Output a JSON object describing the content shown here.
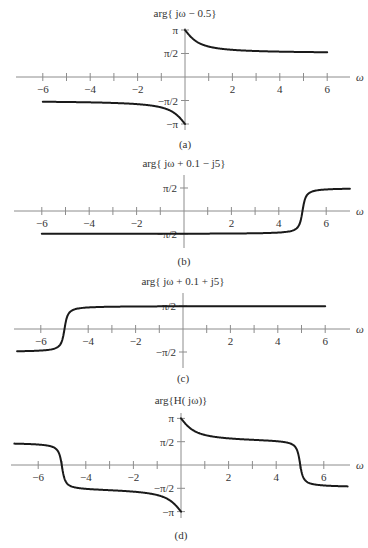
{
  "chart_data": [
    {
      "type": "line",
      "id": "a",
      "title": "arg{ jω − 0.5}",
      "caption": "(a)",
      "xlabel": "ω",
      "function": "atan2(w, -0.5)",
      "x_range": [
        -6,
        6
      ],
      "xlim": [
        -7,
        7
      ],
      "ylim": [
        -3.1416,
        3.1416
      ],
      "xticks": [
        -6,
        -5,
        -4,
        -3,
        -2,
        -1,
        1,
        2,
        3,
        4,
        5,
        6
      ],
      "xtick_labels": [
        {
          "v": -6,
          "t": "−6"
        },
        {
          "v": -4,
          "t": "−4"
        },
        {
          "v": -2,
          "t": "−2"
        },
        {
          "v": 2,
          "t": "2"
        },
        {
          "v": 4,
          "t": "4"
        },
        {
          "v": 6,
          "t": "6"
        }
      ],
      "yticks": [
        {
          "v": 3.1416,
          "t": "π"
        },
        {
          "v": 1.5708,
          "t": "π/2"
        },
        {
          "v": -1.5708,
          "t": "−π/2"
        },
        {
          "v": -3.1416,
          "t": "−π"
        }
      ],
      "samples": {
        "x": [
          -6,
          -4,
          -2,
          -1,
          -0.5,
          -0.1,
          0.1,
          0.5,
          1,
          2,
          4,
          6
        ],
        "y": [
          -1.654,
          -1.695,
          -1.816,
          -2.034,
          -2.356,
          -2.944,
          2.944,
          2.356,
          2.034,
          1.816,
          1.695,
          1.654
        ]
      },
      "grid": false
    },
    {
      "type": "line",
      "id": "b",
      "title": "arg{ jω + 0.1 − j5}",
      "caption": "(b)",
      "xlabel": "ω",
      "function": "atan2(w - 5, 0.1)",
      "x_range": [
        -6,
        7
      ],
      "xlim": [
        -7,
        7
      ],
      "ylim": [
        -1.5708,
        1.5708
      ],
      "xticks": [
        -6,
        -5,
        -4,
        -3,
        -2,
        -1,
        1,
        2,
        3,
        4,
        5,
        6
      ],
      "xtick_labels": [
        {
          "v": -6,
          "t": "−6"
        },
        {
          "v": -4,
          "t": "−4"
        },
        {
          "v": -2,
          "t": "−2"
        },
        {
          "v": 2,
          "t": "2"
        },
        {
          "v": 4,
          "t": "4"
        },
        {
          "v": 6,
          "t": "6"
        }
      ],
      "yticks": [
        {
          "v": 1.5708,
          "t": "π/2"
        },
        {
          "v": -1.5708,
          "t": "−π/2"
        }
      ],
      "samples": {
        "x": [
          -6,
          0,
          4,
          4.5,
          5,
          5.5,
          6,
          7
        ],
        "y": [
          -1.562,
          -1.551,
          -1.471,
          -1.373,
          0,
          1.373,
          1.471,
          1.521
        ]
      },
      "grid": false
    },
    {
      "type": "line",
      "id": "c",
      "title": "arg{ jω + 0.1 + j5}",
      "caption": "(c)",
      "xlabel": "ω",
      "function": "atan2(w + 5, 0.1)",
      "x_range": [
        -7,
        6
      ],
      "xlim": [
        -7,
        7
      ],
      "ylim": [
        -1.5708,
        1.5708
      ],
      "xticks": [
        -6,
        -5,
        -4,
        -3,
        -2,
        -1,
        1,
        2,
        3,
        4,
        5,
        6
      ],
      "xtick_labels": [
        {
          "v": -6,
          "t": "−6"
        },
        {
          "v": -4,
          "t": "−4"
        },
        {
          "v": -2,
          "t": "−2"
        },
        {
          "v": 2,
          "t": "2"
        },
        {
          "v": 4,
          "t": "4"
        },
        {
          "v": 6,
          "t": "6"
        }
      ],
      "yticks": [
        {
          "v": 1.5708,
          "t": "π/2"
        },
        {
          "v": -1.5708,
          "t": "−π/2"
        }
      ],
      "samples": {
        "x": [
          -7,
          -6,
          -5.5,
          -5,
          -4.5,
          -4,
          0,
          6
        ],
        "y": [
          -1.521,
          -1.471,
          -1.373,
          0,
          1.373,
          1.471,
          1.551,
          1.562
        ]
      },
      "grid": false
    },
    {
      "type": "line",
      "id": "d",
      "title": "arg{H( jω)}",
      "caption": "(d)",
      "xlabel": "ω",
      "function": "atan2(w,-0.5) - atan2(w-5,0.1) - atan2(w+5,0.1)",
      "x_range": [
        -7,
        7
      ],
      "xlim": [
        -7,
        7
      ],
      "ylim": [
        -3.1416,
        3.1416
      ],
      "xticks": [
        -6,
        -5,
        -4,
        -3,
        -2,
        -1,
        1,
        2,
        3,
        4,
        5,
        6
      ],
      "xtick_labels": [
        {
          "v": -6,
          "t": "−6"
        },
        {
          "v": -4,
          "t": "−4"
        },
        {
          "v": -2,
          "t": "−2"
        },
        {
          "v": 2,
          "t": "2"
        },
        {
          "v": 4,
          "t": "4"
        },
        {
          "v": 6,
          "t": "6"
        }
      ],
      "yticks": [
        {
          "v": 3.1416,
          "t": "π"
        },
        {
          "v": 1.5708,
          "t": "π/2"
        },
        {
          "v": -1.5708,
          "t": "−π/2"
        },
        {
          "v": -3.1416,
          "t": "−π"
        }
      ],
      "samples": {
        "x": [
          -7,
          -6,
          -5,
          -4,
          -2,
          -0.1,
          0.1,
          2,
          4,
          5,
          6,
          7
        ],
        "y": [
          1.6,
          1.45,
          0,
          -1.37,
          -1.5,
          -2.85,
          2.85,
          1.5,
          1.37,
          0,
          -1.45,
          -1.6
        ]
      },
      "grid": false
    }
  ]
}
